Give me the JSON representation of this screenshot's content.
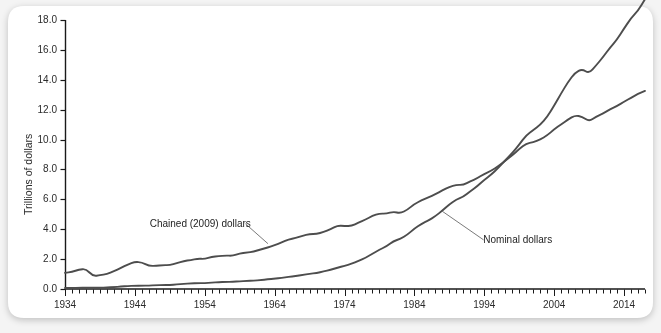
{
  "figure": {
    "background_color": "#f4f4f4",
    "plot_background_color": "#ffffff",
    "line_color": "#4d4d4d",
    "axis_color": "#1a1a1a",
    "text_color": "#2b2b2b"
  },
  "chart_data": {
    "type": "line",
    "title": "",
    "xlabel": "",
    "ylabel": "Trillions of dollars",
    "xlim": [
      1934,
      2017
    ],
    "ylim": [
      0.0,
      18.0
    ],
    "yticks": [
      "0.0",
      "2.0",
      "4.0",
      "6.0",
      "8.0",
      "10.0",
      "12.0",
      "14.0",
      "16.0",
      "18.0"
    ],
    "ytick_values": [
      0.0,
      2.0,
      4.0,
      6.0,
      8.0,
      10.0,
      12.0,
      14.0,
      16.0,
      18.0
    ],
    "xticks": [
      "1934",
      "1944",
      "1954",
      "1964",
      "1974",
      "1984",
      "1994",
      "2004",
      "2014"
    ],
    "xtick_values": [
      1934,
      1944,
      1954,
      1964,
      1974,
      1984,
      1994,
      2004,
      2014
    ],
    "xtick_minor_step": 1,
    "grid": false,
    "legend_position": "inline-annotations",
    "annotations": [
      {
        "label": "Chained (2009) dollars",
        "text_x": 1959,
        "text_y": 4.35,
        "point_x": 1963,
        "point_y": 3.05
      },
      {
        "label": "Nominal dollars",
        "text_x": 1993,
        "text_y": 3.3,
        "point_x": 1988,
        "point_y": 5.2
      }
    ],
    "x": [
      1934,
      1935,
      1936,
      1937,
      1938,
      1939,
      1940,
      1941,
      1942,
      1943,
      1944,
      1945,
      1946,
      1947,
      1948,
      1949,
      1950,
      1951,
      1952,
      1953,
      1954,
      1955,
      1956,
      1957,
      1958,
      1959,
      1960,
      1961,
      1962,
      1963,
      1964,
      1965,
      1966,
      1967,
      1968,
      1969,
      1970,
      1971,
      1972,
      1973,
      1974,
      1975,
      1976,
      1977,
      1978,
      1979,
      1980,
      1981,
      1982,
      1983,
      1984,
      1985,
      1986,
      1987,
      1988,
      1989,
      1990,
      1991,
      1992,
      1993,
      1994,
      1995,
      1996,
      1997,
      1998,
      1999,
      2000,
      2001,
      2002,
      2003,
      2004,
      2005,
      2006,
      2007,
      2008,
      2009,
      2010,
      2011,
      2012,
      2013,
      2014,
      2015,
      2016,
      2017
    ],
    "series": [
      {
        "name": "Chained (2009) dollars",
        "values": [
          1.08,
          1.14,
          1.3,
          1.35,
          0.86,
          0.92,
          1.0,
          1.18,
          1.4,
          1.65,
          1.82,
          1.78,
          1.55,
          1.54,
          1.6,
          1.59,
          1.73,
          1.87,
          1.94,
          2.03,
          2.01,
          2.15,
          2.2,
          2.24,
          2.22,
          2.38,
          2.44,
          2.5,
          2.65,
          2.77,
          2.93,
          3.12,
          3.32,
          3.41,
          3.57,
          3.68,
          3.69,
          3.81,
          4.01,
          4.24,
          4.22,
          4.21,
          4.43,
          4.64,
          4.9,
          5.05,
          5.04,
          5.17,
          5.07,
          5.3,
          5.69,
          5.92,
          6.13,
          6.34,
          6.6,
          6.84,
          6.97,
          6.96,
          7.21,
          7.41,
          7.71,
          7.91,
          8.21,
          8.58,
          8.95,
          9.36,
          9.73,
          9.82,
          10.0,
          10.28,
          10.68,
          11.02,
          11.34,
          11.62,
          11.53,
          11.21,
          11.53,
          11.75,
          12.02,
          12.25,
          12.53,
          12.8,
          13.05,
          13.25
        ]
      },
      {
        "name": "Nominal dollars",
        "values": [
          0.07,
          0.07,
          0.08,
          0.09,
          0.09,
          0.09,
          0.1,
          0.13,
          0.16,
          0.2,
          0.22,
          0.22,
          0.23,
          0.25,
          0.27,
          0.27,
          0.3,
          0.35,
          0.37,
          0.39,
          0.39,
          0.43,
          0.45,
          0.48,
          0.48,
          0.52,
          0.54,
          0.56,
          0.6,
          0.64,
          0.69,
          0.74,
          0.82,
          0.86,
          0.94,
          1.02,
          1.07,
          1.17,
          1.28,
          1.43,
          1.55,
          1.69,
          1.88,
          2.09,
          2.36,
          2.63,
          2.86,
          3.21,
          3.35,
          3.64,
          4.04,
          4.35,
          4.59,
          4.87,
          5.25,
          5.66,
          5.98,
          6.17,
          6.54,
          6.88,
          7.31,
          7.66,
          8.1,
          8.61,
          9.09,
          9.66,
          10.29,
          10.62,
          10.98,
          11.51,
          12.27,
          13.09,
          13.86,
          14.48,
          14.72,
          14.42,
          14.96,
          15.52,
          16.16,
          16.69,
          17.43,
          18.12,
          18.62,
          19.39
        ]
      }
    ]
  }
}
